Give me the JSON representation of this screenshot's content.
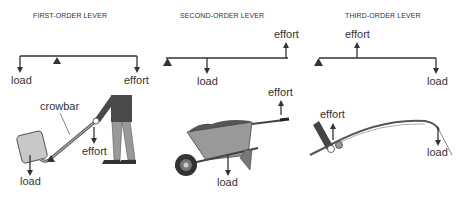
{
  "diagram": {
    "panels": [
      {
        "title": "FIRST-ORDER LEVER",
        "schematic": {
          "left_label": "load",
          "right_label": "effort"
        },
        "illustration": {
          "tool_label": "crowbar",
          "effort_label": "effort",
          "load_label": "load"
        }
      },
      {
        "title": "SECOND-ORDER LEVER",
        "schematic": {
          "top_label": "effort",
          "bottom_label": "load"
        },
        "illustration": {
          "effort_label": "effort",
          "load_label": "load"
        }
      },
      {
        "title": "THIRD-ORDER LEVER",
        "schematic": {
          "top_label": "effort",
          "bottom_label": "load"
        },
        "illustration": {
          "effort_label": "effort",
          "load_label": "load"
        }
      }
    ],
    "colors": {
      "line": "#333333",
      "dark_fill": "#444444",
      "mid_fill": "#888888",
      "light_fill": "#c8c8c8"
    }
  }
}
